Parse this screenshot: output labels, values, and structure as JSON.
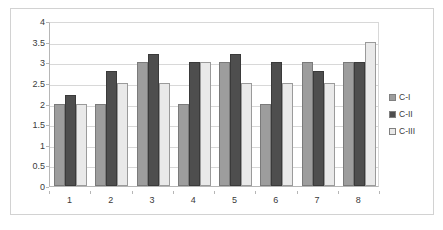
{
  "chart_data": {
    "type": "bar",
    "title": "",
    "subtitle": "",
    "xlabel": "",
    "ylabel": "",
    "categories": [
      "1",
      "2",
      "3",
      "4",
      "5",
      "6",
      "7",
      "8"
    ],
    "series": [
      {
        "name": "C-I",
        "color": "#9d9d9d",
        "values": [
          2.0,
          2.0,
          3.0,
          2.0,
          3.0,
          2.0,
          3.0,
          3.0
        ]
      },
      {
        "name": "C-II",
        "color": "#4e4e4e",
        "values": [
          2.2,
          2.8,
          3.2,
          3.0,
          3.2,
          3.0,
          2.8,
          3.0
        ]
      },
      {
        "name": "C-III",
        "color": "#e9e9e9",
        "values": [
          2.0,
          2.5,
          2.5,
          3.0,
          2.5,
          2.5,
          2.5,
          3.5
        ]
      }
    ],
    "ylim": [
      0,
      4
    ],
    "ytick_labels": [
      "0",
      "0.5",
      "1",
      "1.5",
      "2",
      "2.5",
      "3",
      "3.5",
      "4"
    ],
    "ytick_values": [
      0,
      0.5,
      1,
      1.5,
      2,
      2.5,
      3,
      3.5,
      4
    ],
    "xtick_labels": [
      "1",
      "2",
      "3",
      "4",
      "5",
      "6",
      "7",
      "8"
    ],
    "grid": true,
    "grid_axis": "y",
    "legend": true,
    "legend_position": "right",
    "legend_entries": [
      "C-I",
      "C-II",
      "C-III"
    ],
    "background_color": "#ffffff",
    "border_color": "#d2d2d2",
    "axis_color": "#b6b6b6",
    "gridline_color": "#d8d8d8"
  }
}
